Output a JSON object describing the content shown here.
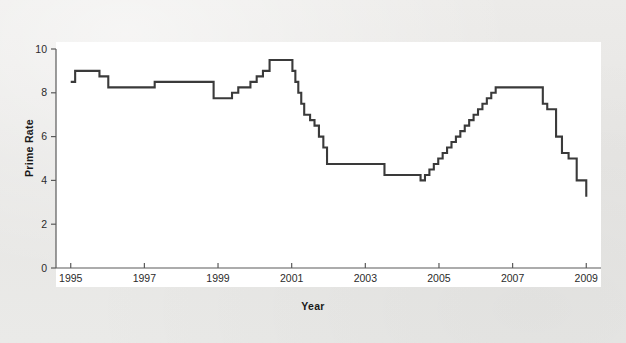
{
  "figure": {
    "background_color": "#e9e9e7",
    "plot_background_color": "#ffffff",
    "line_color": "#3a3a3a",
    "axis_color": "#5a5a5a"
  },
  "axes": {
    "x_title": "Year",
    "y_title": "Prime Rate",
    "x_ticks": [
      "1995",
      "1997",
      "1999",
      "2001",
      "2003",
      "2005",
      "2007",
      "2009"
    ],
    "y_ticks": [
      "0",
      "2",
      "4",
      "6",
      "8",
      "10"
    ]
  },
  "chart_data": {
    "type": "line",
    "title": "",
    "subtitle": "",
    "xlabel": "Year",
    "ylabel": "Prime Rate",
    "xlim": [
      1994.6,
      2009.4
    ],
    "ylim": [
      0,
      10
    ],
    "grid": false,
    "legend": null,
    "interpolation": "step-post",
    "x_tick_values": [
      1995,
      1997,
      1999,
      2001,
      2003,
      2005,
      2007,
      2009
    ],
    "y_tick_values": [
      0,
      2,
      4,
      6,
      8,
      10
    ],
    "series": [
      {
        "name": "Prime Rate",
        "color": "#3a3a3a",
        "x": [
          1995.0,
          1995.12,
          1995.55,
          1995.78,
          1996.02,
          1996.22,
          1997.28,
          1998.76,
          1998.88,
          1999.0,
          1999.38,
          1999.55,
          1999.72,
          1999.88,
          2000.05,
          2000.22,
          2000.4,
          2000.55,
          2000.72,
          2001.02,
          2001.1,
          2001.18,
          2001.26,
          2001.34,
          2001.42,
          2001.5,
          2001.62,
          2001.74,
          2001.86,
          2001.96,
          2002.88,
          2003.52,
          2004.5,
          2004.62,
          2004.74,
          2004.86,
          2004.98,
          2005.1,
          2005.22,
          2005.34,
          2005.46,
          2005.58,
          2005.7,
          2005.82,
          2005.94,
          2006.06,
          2006.18,
          2006.3,
          2006.42,
          2006.54,
          2007.7,
          2007.82,
          2007.94,
          2008.06,
          2008.18,
          2008.34,
          2008.52,
          2008.74,
          2008.88,
          2009.0
        ],
        "y": [
          8.5,
          9.0,
          9.0,
          8.75,
          8.25,
          8.25,
          8.5,
          8.5,
          7.75,
          7.75,
          8.0,
          8.25,
          8.25,
          8.5,
          8.75,
          9.0,
          9.5,
          9.5,
          9.5,
          9.0,
          8.5,
          8.0,
          7.5,
          7.0,
          7.0,
          6.75,
          6.5,
          6.0,
          5.5,
          4.75,
          4.75,
          4.25,
          4.0,
          4.25,
          4.5,
          4.75,
          5.0,
          5.25,
          5.5,
          5.75,
          6.0,
          6.25,
          6.5,
          6.75,
          7.0,
          7.25,
          7.5,
          7.75,
          8.0,
          8.25,
          8.25,
          7.5,
          7.25,
          7.25,
          6.0,
          5.25,
          5.0,
          4.0,
          4.0,
          3.25
        ]
      }
    ],
    "annotations": [
      {
        "text": "peak 9.5 around 2000-2001"
      },
      {
        "text": "trough 4.0 from mid-2003 to mid-2004"
      },
      {
        "text": "secondary plateau 8.25 from mid-2006 to late 2007"
      },
      {
        "text": "final value 3.25 at 2009"
      }
    ]
  }
}
